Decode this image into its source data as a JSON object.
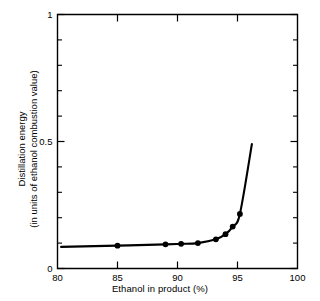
{
  "chart_data": {
    "type": "line",
    "title": "",
    "xlabel": "Ethanol in product (%)",
    "ylabel": "Distillation energy (in units of ethanol combustion value)",
    "ylabel_line1": "Distillation energy",
    "ylabel_line2": "(in units of ethanol combustion value)",
    "xlim": [
      80,
      100
    ],
    "ylim": [
      0,
      1
    ],
    "grid": false,
    "legend": null,
    "xticks": [
      80,
      85,
      90,
      95,
      100
    ],
    "xtick_labels": [
      "80",
      "85",
      "90",
      "95",
      "100"
    ],
    "yticks": [
      0,
      0.5,
      1
    ],
    "ytick_labels": [
      "0",
      "0.5",
      "1"
    ],
    "yticks_minor": [
      0.1,
      0.2,
      0.3,
      0.4,
      0.6,
      0.7,
      0.8,
      0.9
    ],
    "series": [
      {
        "name": "Distillation energy",
        "color": "#000000",
        "marker": "filled-circle",
        "x": [
          80.3,
          85.0,
          89.0,
          90.3,
          91.7,
          93.2,
          94.0,
          94.6,
          95.2,
          96.2
        ],
        "y": [
          0.085,
          0.09,
          0.095,
          0.097,
          0.1,
          0.115,
          0.135,
          0.165,
          0.215,
          0.49
        ],
        "marker_x": [
          85.0,
          89.0,
          90.3,
          91.7,
          93.2,
          94.0,
          94.6,
          95.2
        ],
        "marker_y": [
          0.09,
          0.095,
          0.097,
          0.1,
          0.115,
          0.135,
          0.165,
          0.215
        ]
      }
    ]
  },
  "figure": {
    "background": "#ffffff",
    "foreground": "#000000"
  }
}
